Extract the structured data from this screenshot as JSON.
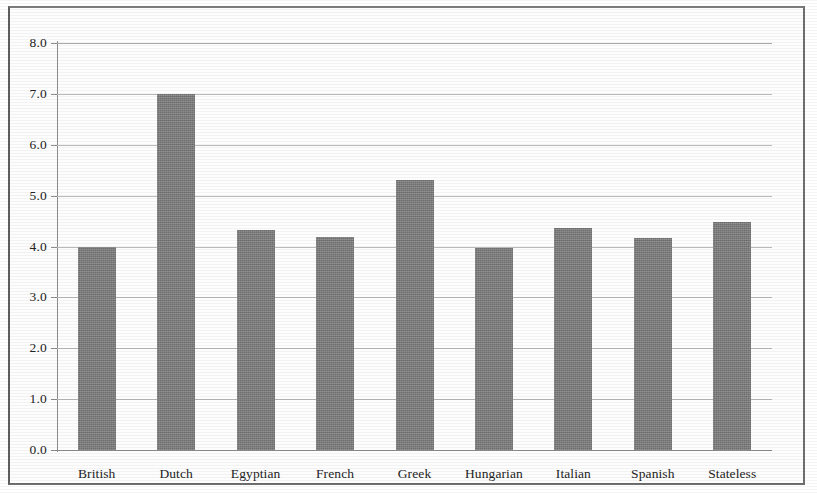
{
  "chart_data": {
    "type": "bar",
    "title": "",
    "subtitle": "",
    "xlabel": "",
    "ylabel": "",
    "categories": [
      "British",
      "Dutch",
      "Egyptian",
      "French",
      "Greek",
      "Hungarian",
      "Italian",
      "Spanish",
      "Stateless"
    ],
    "values": [
      4.0,
      7.0,
      4.33,
      4.18,
      5.3,
      3.98,
      4.37,
      4.16,
      4.48
    ],
    "ylim": [
      0.0,
      8.0
    ],
    "y_ticks": [
      "0.0",
      "1.0",
      "2.0",
      "3.0",
      "4.0",
      "5.0",
      "6.0",
      "7.0",
      "8.0"
    ],
    "y_tick_values": [
      0,
      1,
      2,
      3,
      4,
      5,
      6,
      7,
      8
    ],
    "grid": true,
    "legend": false,
    "legend_position": "none",
    "series": [
      {
        "name": "",
        "values": [
          4.0,
          7.0,
          4.33,
          4.18,
          5.3,
          3.98,
          4.37,
          4.16,
          4.48
        ]
      }
    ],
    "colors": {
      "bar_fill": "#7c7c7c",
      "gridline": "#b9b9b9",
      "axis": "#8d8d8d",
      "text": "#242424",
      "page_border": "#6f6f6f",
      "background": "#fdfdfd"
    }
  }
}
